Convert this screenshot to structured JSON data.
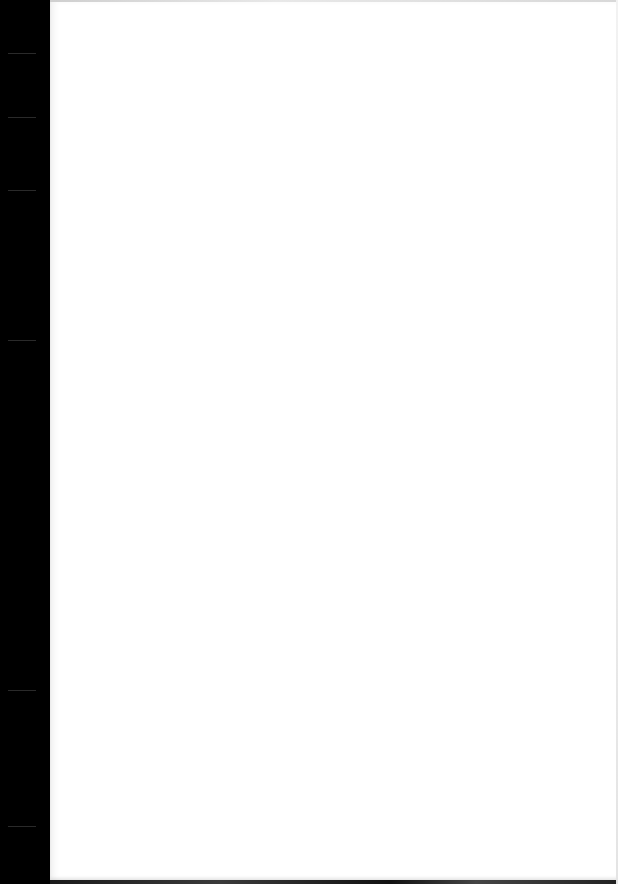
{
  "document": {
    "type": "blank-page",
    "text": "",
    "colors": {
      "background": "#000000",
      "paper": "#ffffff"
    }
  }
}
